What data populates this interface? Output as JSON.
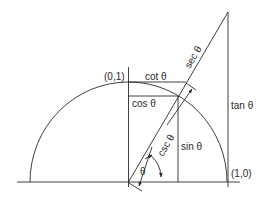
{
  "diagram": {
    "labels": {
      "point_top": "(0,1)",
      "point_right": "(1,0)",
      "cot": "cot θ",
      "cos": "cos θ",
      "sin": "sin θ",
      "tan": "tan θ",
      "sec": "sec θ",
      "csc": "csc θ",
      "angle": "θ"
    },
    "colors": {
      "stroke": "#2a2a2a",
      "background": "#ffffff"
    }
  }
}
